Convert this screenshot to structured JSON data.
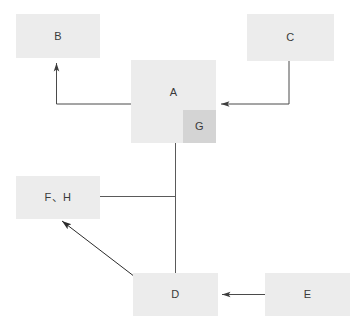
{
  "diagram": {
    "type": "flow-diagram",
    "canvas": {
      "width": 360,
      "height": 330,
      "background": "#ffffff"
    },
    "style": {
      "node_fill": "#ececec",
      "node_fill_highlight": "#d4d4d4",
      "label_color": "#3a3a3a",
      "edge_color": "#4a4a4a",
      "edge_width": 1
    },
    "nodes": [
      {
        "id": "B",
        "label": "B",
        "x": 16,
        "y": 14,
        "w": 84,
        "h": 44,
        "fill": "#ececec"
      },
      {
        "id": "C",
        "label": "C",
        "x": 247,
        "y": 14,
        "w": 87,
        "h": 47,
        "fill": "#ececec"
      },
      {
        "id": "A",
        "label": "A",
        "x": 131,
        "y": 60,
        "w": 85,
        "h": 83,
        "fill": "#ececec"
      },
      {
        "id": "G",
        "label": "G",
        "x": 183,
        "y": 110,
        "w": 33,
        "h": 33,
        "fill": "#d4d4d4"
      },
      {
        "id": "FH",
        "label": "F、H",
        "x": 16,
        "y": 176,
        "w": 84,
        "h": 43,
        "fill": "#ececec"
      },
      {
        "id": "D",
        "label": "D",
        "x": 133,
        "y": 273,
        "w": 85,
        "h": 43,
        "fill": "#ececec"
      },
      {
        "id": "E",
        "label": "E",
        "x": 265,
        "y": 273,
        "w": 85,
        "h": 43,
        "fill": "#ececec"
      }
    ],
    "edges": [
      {
        "id": "a-to-b",
        "from": "A",
        "to": "B",
        "arrow": true,
        "shape": "elbow-up-left"
      },
      {
        "id": "c-to-a",
        "from": "C",
        "to": "A",
        "arrow": true,
        "shape": "elbow-down-left"
      },
      {
        "id": "a-to-d",
        "from": "A",
        "to": "D",
        "arrow": false,
        "shape": "vertical"
      },
      {
        "id": "trunk-to-fh",
        "from": "A",
        "to": "FH",
        "arrow": false,
        "shape": "horizontal"
      },
      {
        "id": "d-to-fh",
        "from": "D",
        "to": "FH",
        "arrow": true,
        "shape": "diagonal"
      },
      {
        "id": "e-to-d",
        "from": "E",
        "to": "D",
        "arrow": true,
        "shape": "horizontal"
      }
    ]
  }
}
